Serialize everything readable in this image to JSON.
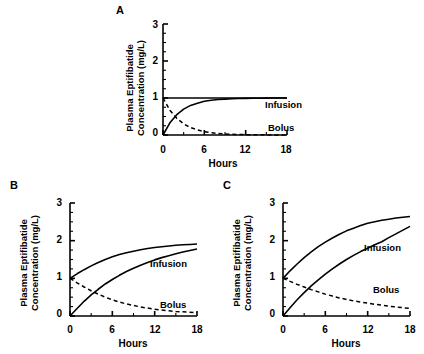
{
  "figure": {
    "axis_titles": {
      "y_line1": "Plasma Eptifibatide",
      "y_line2": "Concentration (mg/L)",
      "x": "Hours"
    },
    "series_labels": {
      "infusion": "Infusion",
      "bolus": "Bolus"
    },
    "y_ticks": [
      "0",
      "1",
      "2",
      "3"
    ],
    "x_ticks": [
      "0",
      "6",
      "12",
      "18"
    ],
    "panels": [
      {
        "letter": "A"
      },
      {
        "letter": "B"
      },
      {
        "letter": "C"
      }
    ]
  },
  "chart_data": [
    {
      "type": "line",
      "panel": "A",
      "title": "A",
      "xlabel": "Hours",
      "ylabel": "Plasma Eptifibatide Concentration (mg/L)",
      "xlim": [
        0,
        18
      ],
      "ylim": [
        0,
        3
      ],
      "xticks": [
        0,
        6,
        12,
        18
      ],
      "yticks": [
        0,
        1,
        2,
        3
      ],
      "xminorticks": [
        3,
        9,
        15
      ],
      "yminorticks": [
        0.25,
        0.5,
        0.75,
        1.25,
        1.5,
        1.75,
        2.25,
        2.5,
        2.75
      ],
      "grid": false,
      "legend": "inline-right",
      "series": [
        {
          "name": "Steady-state line",
          "style": "solid",
          "x": [
            0,
            18
          ],
          "values": [
            1.0,
            1.0
          ]
        },
        {
          "name": "Infusion",
          "style": "solid",
          "x": [
            0,
            1,
            2,
            3,
            4,
            5,
            6,
            7,
            8,
            9,
            10,
            11,
            12,
            13,
            14,
            15,
            16,
            17,
            18
          ],
          "values": [
            0.0,
            0.33,
            0.55,
            0.7,
            0.8,
            0.86,
            0.91,
            0.94,
            0.96,
            0.97,
            0.98,
            0.985,
            0.99,
            0.993,
            0.995,
            0.997,
            0.998,
            0.999,
            1.0
          ]
        },
        {
          "name": "Bolus",
          "style": "dashed",
          "x": [
            0,
            1,
            2,
            3,
            4,
            5,
            6,
            7,
            8,
            9,
            10,
            11,
            12,
            13,
            14,
            15,
            16,
            17,
            18
          ],
          "values": [
            1.0,
            0.67,
            0.45,
            0.3,
            0.2,
            0.14,
            0.09,
            0.06,
            0.04,
            0.03,
            0.02,
            0.015,
            0.01,
            0.007,
            0.005,
            0.003,
            0.002,
            0.001,
            0.0
          ]
        }
      ]
    },
    {
      "type": "line",
      "panel": "B",
      "title": "B",
      "xlabel": "Hours",
      "ylabel": "Plasma Eptifibatide Concentration (mg/L)",
      "xlim": [
        0,
        18
      ],
      "ylim": [
        0,
        3
      ],
      "xticks": [
        0,
        6,
        12,
        18
      ],
      "yticks": [
        0,
        1,
        2,
        3
      ],
      "xminorticks": [
        3,
        9,
        15
      ],
      "yminorticks": [
        0.25,
        0.5,
        0.75,
        1.25,
        1.5,
        1.75,
        2.25,
        2.5,
        2.75
      ],
      "grid": false,
      "legend": "inline-right",
      "series": [
        {
          "name": "Bolus plus infusion",
          "style": "solid",
          "x": [
            0,
            1,
            2,
            3,
            4,
            5,
            6,
            7,
            8,
            9,
            10,
            11,
            12,
            13,
            14,
            15,
            16,
            17,
            18
          ],
          "values": [
            1.0,
            1.12,
            1.23,
            1.33,
            1.42,
            1.5,
            1.57,
            1.63,
            1.68,
            1.72,
            1.76,
            1.79,
            1.82,
            1.84,
            1.86,
            1.88,
            1.89,
            1.9,
            1.91
          ]
        },
        {
          "name": "Infusion",
          "style": "solid",
          "x": [
            0,
            1,
            2,
            3,
            4,
            5,
            6,
            7,
            8,
            9,
            10,
            11,
            12,
            13,
            14,
            15,
            16,
            17,
            18
          ],
          "values": [
            0.0,
            0.2,
            0.39,
            0.56,
            0.71,
            0.85,
            0.97,
            1.08,
            1.18,
            1.27,
            1.35,
            1.42,
            1.49,
            1.55,
            1.6,
            1.65,
            1.7,
            1.74,
            1.78
          ]
        },
        {
          "name": "Bolus",
          "style": "dashed",
          "x": [
            0,
            1,
            2,
            3,
            4,
            5,
            6,
            7,
            8,
            9,
            10,
            11,
            12,
            13,
            14,
            15,
            16,
            17,
            18
          ],
          "values": [
            1.0,
            0.88,
            0.77,
            0.67,
            0.58,
            0.5,
            0.43,
            0.37,
            0.32,
            0.28,
            0.24,
            0.21,
            0.18,
            0.16,
            0.14,
            0.12,
            0.11,
            0.1,
            0.09
          ]
        }
      ]
    },
    {
      "type": "line",
      "panel": "C",
      "title": "C",
      "xlabel": "Hours",
      "ylabel": "Plasma Eptifibatide Concentration (mg/L)",
      "xlim": [
        0,
        18
      ],
      "ylim": [
        0,
        3
      ],
      "xticks": [
        0,
        6,
        12,
        18
      ],
      "yticks": [
        0,
        1,
        2,
        3
      ],
      "xminorticks": [
        3,
        9,
        15
      ],
      "yminorticks": [
        0.25,
        0.5,
        0.75,
        1.25,
        1.5,
        1.75,
        2.25,
        2.5,
        2.75
      ],
      "grid": false,
      "legend": "inline-right",
      "series": [
        {
          "name": "Bolus plus infusion",
          "style": "solid",
          "x": [
            0,
            1,
            2,
            3,
            4,
            5,
            6,
            7,
            8,
            9,
            10,
            11,
            12,
            13,
            14,
            15,
            16,
            17,
            18
          ],
          "values": [
            1.0,
            1.2,
            1.38,
            1.55,
            1.7,
            1.84,
            1.96,
            2.07,
            2.17,
            2.26,
            2.33,
            2.4,
            2.46,
            2.5,
            2.54,
            2.57,
            2.6,
            2.62,
            2.64
          ]
        },
        {
          "name": "Infusion",
          "style": "solid",
          "x": [
            0,
            1,
            2,
            3,
            4,
            5,
            6,
            7,
            8,
            9,
            10,
            11,
            12,
            13,
            14,
            15,
            16,
            17,
            18
          ],
          "values": [
            0.0,
            0.22,
            0.43,
            0.62,
            0.8,
            0.96,
            1.11,
            1.25,
            1.38,
            1.5,
            1.61,
            1.71,
            1.8,
            1.89,
            1.97,
            2.08,
            2.18,
            2.28,
            2.38
          ]
        },
        {
          "name": "Bolus",
          "style": "dashed",
          "x": [
            0,
            1,
            2,
            3,
            4,
            5,
            6,
            7,
            8,
            9,
            10,
            11,
            12,
            13,
            14,
            15,
            16,
            17,
            18
          ],
          "values": [
            1.0,
            0.92,
            0.84,
            0.77,
            0.7,
            0.64,
            0.58,
            0.53,
            0.48,
            0.44,
            0.4,
            0.37,
            0.34,
            0.31,
            0.29,
            0.26,
            0.24,
            0.22,
            0.2
          ]
        }
      ]
    }
  ]
}
